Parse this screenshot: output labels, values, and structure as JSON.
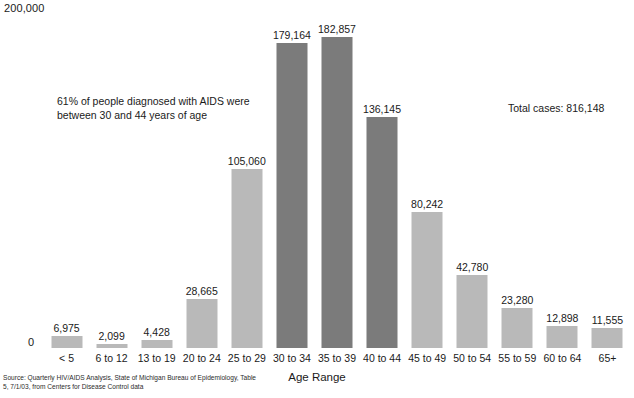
{
  "chart_data": {
    "type": "bar",
    "title": "",
    "xlabel": "Age Range",
    "ylabel": "",
    "ylim": [
      0,
      200000
    ],
    "grid": false,
    "legend": "none",
    "categories": [
      "< 5",
      "6 to 12",
      "13 to 19",
      "20 to 24",
      "25 to 29",
      "30 to 34",
      "35 to 39",
      "40 to 44",
      "45 to 49",
      "50 to 54",
      "55 to 59",
      "60 to 64",
      "65+"
    ],
    "values": [
      6975,
      2099,
      4428,
      28665,
      105060,
      179164,
      182857,
      136145,
      80242,
      42780,
      23280,
      12898,
      11555
    ],
    "value_labels": [
      "6,975",
      "2,099",
      "4,428",
      "28,665",
      "105,060",
      "179,164",
      "182,857",
      "136,145",
      "80,242",
      "42,780",
      "23,280",
      "12,898",
      "11,555"
    ],
    "highlighted": [
      false,
      false,
      false,
      false,
      false,
      true,
      true,
      true,
      false,
      false,
      false,
      false,
      false
    ],
    "y_tick_labels": [
      "0",
      "200,000"
    ],
    "annotations": [
      "61% of people diagnosed with AIDS were\nbetween 30 and 44 years of age",
      "Total cases: 816,148"
    ],
    "source": "Source: Quarterly HIV/AIDS Analysis, State of Michigan Bureau of Epidemiology, Table\n5, 7/1/03, from Centers for Disease Control data",
    "colors": {
      "bar_light": "#b9b9b9",
      "bar_dark": "#7b7b7b",
      "text": "#1a1a1a",
      "background": "#ffffff"
    }
  },
  "axis": {
    "y_top": "200,000",
    "y_zero": "0",
    "x_title": "Age Range"
  },
  "annotation": {
    "percent_note": "61% of people diagnosed with AIDS were\nbetween 30 and 44 years of age",
    "total_cases": "Total cases: 816,148"
  },
  "footer": {
    "source": "Source: Quarterly HIV/AIDS Analysis, State of Michigan Bureau of Epidemiology, Table\n5, 7/1/03, from Centers for Disease Control data"
  }
}
